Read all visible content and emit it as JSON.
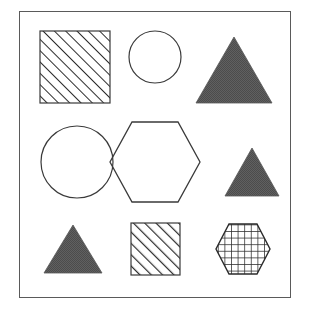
{
  "figure": {
    "title": "Geometric shapes grid",
    "background_color": "#ffffff",
    "frame": {
      "name": "panel-frame",
      "x": 19,
      "y": 11,
      "width": 272,
      "height": 287,
      "stroke_color": "#5a5a5a",
      "stroke_width": 1,
      "fill": "none"
    },
    "grid": {
      "rows": 3,
      "cols": 3
    },
    "palette": {
      "outline": "#3a3a3a",
      "frame_stroke": "#5a5a5a",
      "solid_fill": "#585858",
      "hatch_stroke": "#2b2b2b",
      "background": "#ffffff"
    },
    "shapes": [
      {
        "id": "shape-1",
        "name": "square-hatched-large",
        "row": 1,
        "col": 1,
        "type": "square",
        "fill_style": "diagonal-hatch",
        "hatch_direction": "/",
        "x": 40,
        "y": 31,
        "width": 70,
        "height": 72,
        "stroke_color": "#3a3a3a",
        "fill_color": "none"
      },
      {
        "id": "shape-2",
        "name": "circle-outline-small",
        "row": 1,
        "col": 2,
        "type": "circle",
        "fill_style": "none",
        "cx": 155,
        "cy": 57,
        "r": 26,
        "stroke_color": "#3a3a3a",
        "fill_color": "none"
      },
      {
        "id": "shape-3",
        "name": "triangle-solid-large",
        "row": 1,
        "col": 3,
        "type": "triangle",
        "fill_style": "solid",
        "x": 196,
        "y": 37,
        "width": 76,
        "height": 66,
        "stroke_color": "#585858",
        "fill_color": "#585858"
      },
      {
        "id": "shape-4",
        "name": "circle-outline-large",
        "row": 2,
        "col": 1,
        "type": "circle",
        "fill_style": "none",
        "cx": 77,
        "cy": 162,
        "r": 36,
        "stroke_color": "#3a3a3a",
        "fill_color": "none"
      },
      {
        "id": "shape-5",
        "name": "hexagon-outline-large",
        "row": 2,
        "col": 2,
        "type": "hexagon",
        "orientation": "flat-top",
        "fill_style": "none",
        "cx": 155,
        "cy": 162,
        "rx": 45,
        "ry": 40,
        "stroke_color": "#3a3a3a",
        "fill_color": "none"
      },
      {
        "id": "shape-6",
        "name": "triangle-solid-medium",
        "row": 2,
        "col": 3,
        "type": "triangle",
        "fill_style": "solid",
        "x": 225,
        "y": 148,
        "width": 54,
        "height": 48,
        "stroke_color": "#585858",
        "fill_color": "#585858"
      },
      {
        "id": "shape-7",
        "name": "triangle-solid-small",
        "row": 3,
        "col": 1,
        "type": "triangle",
        "fill_style": "solid",
        "x": 44,
        "y": 225,
        "width": 58,
        "height": 48,
        "stroke_color": "#585858",
        "fill_color": "#585858"
      },
      {
        "id": "shape-8",
        "name": "square-hatched-medium",
        "row": 3,
        "col": 2,
        "type": "square",
        "fill_style": "diagonal-hatch",
        "hatch_direction": "/",
        "x": 131,
        "y": 223,
        "width": 49,
        "height": 52,
        "stroke_color": "#3a3a3a",
        "fill_color": "none"
      },
      {
        "id": "shape-9",
        "name": "hexagon-grid-hatched-small",
        "row": 3,
        "col": 3,
        "type": "hexagon",
        "orientation": "flat-top",
        "fill_style": "grid-hatch",
        "cx": 243,
        "cy": 249,
        "rx": 27,
        "ry": 27,
        "stroke_color": "#2b2b2b",
        "fill_color": "none"
      }
    ]
  }
}
